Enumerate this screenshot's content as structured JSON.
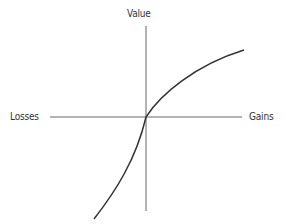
{
  "diagram": {
    "labels": {
      "y_axis_top": "Value",
      "x_axis_left": "Losses",
      "x_axis_right": "Gains"
    },
    "colors": {
      "axis": "#555555",
      "curve": "#333333",
      "text": "#333333"
    },
    "curve": {
      "description": "S-shaped value curve: concave for gains, convex and steeper for losses",
      "points_px": [
        [
          94,
          219
        ],
        [
          110,
          200
        ],
        [
          128,
          170
        ],
        [
          140,
          140
        ],
        [
          146,
          117
        ],
        [
          170,
          93
        ],
        [
          200,
          70
        ],
        [
          244,
          50
        ]
      ]
    }
  }
}
